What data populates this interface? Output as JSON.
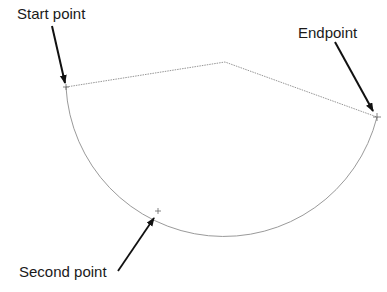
{
  "diagram": {
    "type": "three-point-arc",
    "labels": {
      "start": "Start point",
      "end": "Endpoint",
      "second": "Second point"
    },
    "points": {
      "start": {
        "x": 66,
        "y": 87
      },
      "second": {
        "x": 158,
        "y": 211
      },
      "end": {
        "x": 377,
        "y": 117
      },
      "apex": {
        "x": 225,
        "y": 62
      }
    },
    "colors": {
      "arc": "#9a9a9a",
      "guide": "#8a8a8a",
      "arrow": "#111111",
      "text": "#1a1a1a",
      "background": "#ffffff"
    }
  }
}
